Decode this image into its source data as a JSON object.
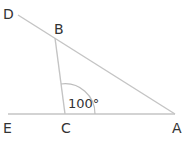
{
  "diagram": {
    "type": "geometry-angle-figure",
    "points": {
      "D": {
        "label": "D"
      },
      "B": {
        "label": "B"
      },
      "E": {
        "label": "E"
      },
      "C": {
        "label": "C"
      },
      "A": {
        "label": "A"
      }
    },
    "segments": [
      "D-A (through B)",
      "E-A (through C)",
      "B-C"
    ],
    "angle": {
      "vertex": "C",
      "between": [
        "B",
        "A"
      ],
      "label": "100°"
    },
    "colors": {
      "line": "#c4c4c4",
      "text": "#333333",
      "background": "#ffffff"
    }
  }
}
